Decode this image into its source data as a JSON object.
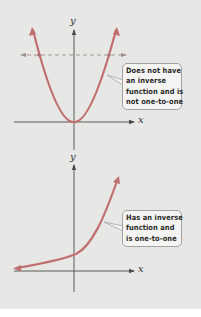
{
  "colors": {
    "background": "#e7e7e5",
    "curve": "#c16e6e",
    "axis": "#4a4a4a",
    "dashed": "#b09090",
    "callout_bg": "#f4f4f2",
    "callout_border": "#a3a3a3"
  },
  "graphs": [
    {
      "name": "parabola",
      "function": "y = x^2",
      "x_label": "x",
      "y_label": "y",
      "callout": {
        "lines": [
          "Does not have",
          "an inverse",
          "function and is",
          "not one-to-one"
        ]
      },
      "horizontal_line_test": "dashed horizontal line intersects curve twice"
    },
    {
      "name": "exponential",
      "function": "y = b^x",
      "x_label": "x",
      "y_label": "y",
      "callout": {
        "lines": [
          "Has an inverse",
          "function and",
          "is one-to-one"
        ]
      }
    }
  ]
}
